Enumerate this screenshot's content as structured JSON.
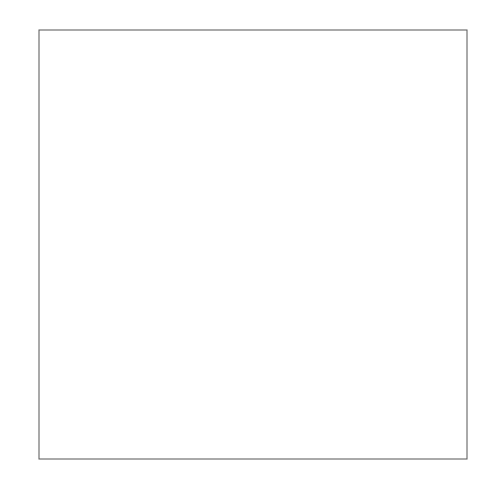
{
  "chart_data": {
    "type": "contour",
    "xlabel": "",
    "ylabel": "",
    "xlim": [
      -3,
      3
    ],
    "ylim": [
      -2,
      2
    ],
    "grid": false,
    "legend": null,
    "function": "Z = 2 * (exp(-(x-1)^2 - (y-1)^2) - exp(-x^2 - y^2))",
    "levels": [
      -1.0,
      -0.5,
      0.0,
      0.5,
      1.0,
      1.5
    ],
    "level_labels": [
      "-1.000",
      "-0.500",
      "0.000",
      "0.500",
      "1.000",
      "1.500"
    ],
    "line_color": "#2b2b2b",
    "negative_linestyle": "solid",
    "x_ticks": [
      -3,
      -2,
      -1,
      0,
      1,
      2
    ],
    "x_tick_labels": [
      "−3",
      "−2",
      "−1",
      "0",
      "1",
      "2"
    ],
    "y_ticks": [
      -2.0,
      -1.5,
      -1.0,
      -0.5,
      0.0,
      0.5,
      1.0,
      1.5
    ],
    "y_tick_labels": [
      "−2.0",
      "−1.5",
      "−1.0",
      "−0.5",
      "0.0",
      "0.5",
      "1.0",
      "1.5"
    ],
    "label_positions": [
      {
        "text": "0.000",
        "x": -0.75,
        "y": 1.98,
        "angle": 0
      },
      {
        "text": "0.500",
        "x": 0.42,
        "y": 0.7,
        "angle": 20
      },
      {
        "text": "1.000",
        "x": 1.15,
        "y": 0.53,
        "angle": 12
      },
      {
        "text": "1.500",
        "x": 1.65,
        "y": 0.79,
        "angle": -8
      },
      {
        "text": "-0.500",
        "x": 0.4,
        "y": 0.26,
        "angle": 25
      },
      {
        "text": "-1.000",
        "x": 0.68,
        "y": 0.02,
        "angle": 40
      },
      {
        "text": "0.000",
        "x": 2.55,
        "y": -0.35,
        "angle": 30
      }
    ]
  }
}
